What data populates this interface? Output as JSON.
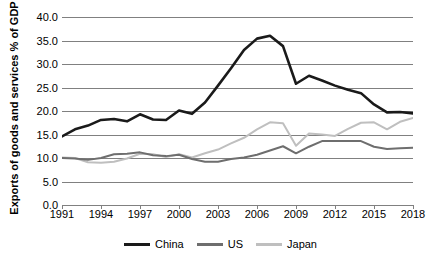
{
  "chart_data": {
    "type": "line",
    "title": "",
    "xlabel": "",
    "ylabel": "Exports of goods and services % of GDP",
    "xlim": [
      1991,
      2018
    ],
    "ylim": [
      0.0,
      40.0
    ],
    "ytick_step": 5.0,
    "grid": true,
    "legend_position": "bottom",
    "yticks": [
      "0.0",
      "5.0",
      "10.0",
      "15.0",
      "20.0",
      "25.0",
      "30.0",
      "35.0",
      "40.0"
    ],
    "ytick_values": [
      0.0,
      5.0,
      10.0,
      15.0,
      20.0,
      25.0,
      30.0,
      35.0,
      40.0
    ],
    "xticks": [
      "1991",
      "1994",
      "1997",
      "2000",
      "2003",
      "2006",
      "2009",
      "2012",
      "2015",
      "2018"
    ],
    "xtick_values": [
      1991,
      1994,
      1997,
      2000,
      2003,
      2006,
      2009,
      2012,
      2015,
      2018
    ],
    "x": [
      1991,
      1992,
      1993,
      1994,
      1995,
      1996,
      1997,
      1998,
      1999,
      2000,
      2001,
      2002,
      2003,
      2004,
      2005,
      2006,
      2007,
      2008,
      2009,
      2010,
      2011,
      2012,
      2013,
      2014,
      2015,
      2016,
      2017,
      2018
    ],
    "series": [
      {
        "name": "China",
        "color": "#1a1a1a",
        "values": [
          14.6,
          16.1,
          16.9,
          18.1,
          18.3,
          17.8,
          19.3,
          18.2,
          18.1,
          20.1,
          19.4,
          21.8,
          25.4,
          29.1,
          33.0,
          35.4,
          36.0,
          33.8,
          25.8,
          27.5,
          26.5,
          25.4,
          24.5,
          23.8,
          21.4,
          19.7,
          19.8,
          19.5
        ]
      },
      {
        "name": "US",
        "color": "#6e6e6e",
        "values": [
          10.0,
          9.9,
          9.6,
          10.0,
          10.8,
          10.9,
          11.2,
          10.6,
          10.4,
          10.7,
          9.8,
          9.2,
          9.2,
          9.8,
          10.1,
          10.7,
          11.6,
          12.5,
          11.0,
          12.4,
          13.6,
          13.6,
          13.6,
          13.6,
          12.4,
          11.9,
          12.1,
          12.2
        ]
      },
      {
        "name": "Japan",
        "color": "#bfbfbf",
        "values": [
          10.1,
          10.0,
          9.1,
          9.0,
          9.2,
          9.9,
          10.9,
          10.8,
          10.2,
          10.8,
          10.1,
          11.0,
          11.8,
          13.1,
          14.3,
          16.1,
          17.6,
          17.4,
          12.6,
          15.2,
          15.0,
          14.7,
          16.2,
          17.5,
          17.6,
          16.1,
          17.7,
          18.5
        ]
      }
    ]
  },
  "legend": {
    "items": [
      {
        "label": "China"
      },
      {
        "label": "US"
      },
      {
        "label": "Japan"
      }
    ]
  }
}
